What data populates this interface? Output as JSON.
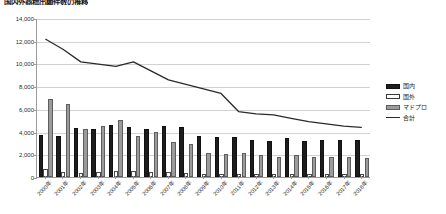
{
  "chart_data": {
    "type": "bar",
    "title": "国内外商標出願件数の推移",
    "xlabel": "",
    "ylabel": "",
    "ylim": [
      0,
      14000
    ],
    "ytick_step": 2000,
    "ytick_labels": [
      "0",
      "2,000",
      "4,000",
      "6,000",
      "8,000",
      "10,000",
      "12,000",
      "14,000"
    ],
    "grid": true,
    "legend_position": "right",
    "categories": [
      "2000年",
      "2001年",
      "2002年",
      "2003年",
      "2004年",
      "2005年",
      "2006年",
      "2007年",
      "2008年",
      "2009年",
      "2010年",
      "2011年",
      "2012年",
      "2013年",
      "2014年",
      "2015年",
      "2016年",
      "2017年",
      "2018年"
    ],
    "series": [
      {
        "name": "国内",
        "style": "bar-black",
        "color": "#1d1d1d",
        "values": [
          3700,
          3600,
          4300,
          4200,
          4600,
          4400,
          4200,
          4500,
          4400,
          3600,
          3500,
          3500,
          3300,
          3200,
          3400,
          3200,
          3300,
          3300,
          3300
        ]
      },
      {
        "name": "国外",
        "style": "bar-white",
        "color": "#ffffff",
        "values": [
          700,
          400,
          350,
          400,
          550,
          500,
          450,
          400,
          350,
          300,
          300,
          300,
          250,
          250,
          250,
          250,
          250,
          250,
          250
        ]
      },
      {
        "name": "マドプロ",
        "style": "bar-gray",
        "color": "#9b9b9b",
        "values": [
          6900,
          6400,
          4200,
          4500,
          5000,
          3600,
          4000,
          3100,
          2900,
          2100,
          2000,
          2100,
          1900,
          1800,
          1900,
          1800,
          1800,
          1800,
          1700
        ]
      },
      {
        "name": "合計",
        "style": "line",
        "color": "#2a2a2a",
        "values": [
          12200,
          11300,
          10200,
          10000,
          9800,
          10200,
          9400,
          8600,
          8200,
          7800,
          7400,
          5800,
          5600,
          5500,
          5200,
          4900,
          4700,
          4500,
          4400
        ]
      }
    ]
  },
  "legend": {
    "items": [
      {
        "label": "国内"
      },
      {
        "label": "国外"
      },
      {
        "label": "マドプロ"
      },
      {
        "label": "合計"
      }
    ]
  }
}
